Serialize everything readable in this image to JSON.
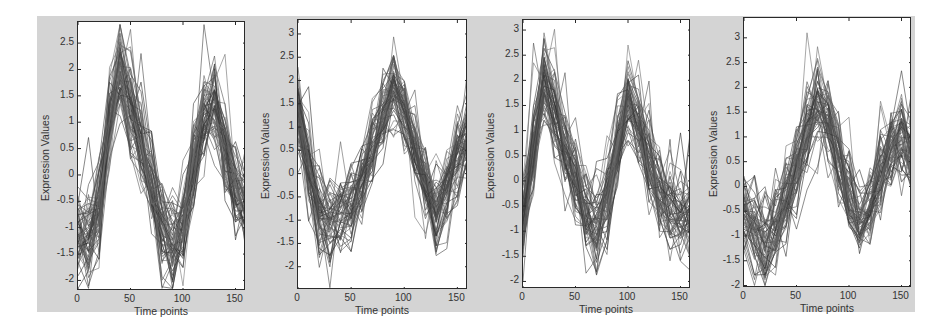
{
  "figure": {
    "background_color": "#d4d4d4",
    "plot_background": "#ffffff",
    "line_color": "#3c3c3c"
  },
  "chart_data": [
    {
      "type": "line",
      "title": "",
      "xlabel": "Time points",
      "ylabel": "Expression Values",
      "xlim": [
        0,
        160
      ],
      "ylim": [
        -2.2,
        2.9
      ],
      "xticks": [
        0,
        50,
        100,
        150
      ],
      "xtick_labels": [
        "0",
        "50",
        "100",
        "150"
      ],
      "yticks": [
        -2,
        -1.5,
        -1,
        -0.5,
        0,
        0.5,
        1,
        1.5,
        2,
        2.5
      ],
      "ytick_labels": [
        "-2",
        "-1.5",
        "-1",
        "-0.5",
        "0",
        "0.5",
        "1",
        "1.5",
        "2",
        "2.5"
      ],
      "grid": false,
      "series_count": 60,
      "description": "Cluster of ~60 gene expression profiles; peaks near t=40 and t=125, troughs near t=5 and t=95",
      "mean_profile": {
        "x": [
          0,
          10,
          20,
          30,
          40,
          50,
          60,
          70,
          80,
          90,
          100,
          110,
          120,
          130,
          140,
          150,
          160
        ],
        "y": [
          -1.1,
          -1.2,
          -0.6,
          0.9,
          1.8,
          1.2,
          0.5,
          -0.2,
          -0.9,
          -1.3,
          -0.9,
          0.2,
          1.0,
          1.2,
          0.4,
          -0.3,
          -0.6
        ]
      }
    },
    {
      "type": "line",
      "title": "",
      "xlabel": "Time points",
      "ylabel": "Expression Values",
      "xlim": [
        0,
        160
      ],
      "ylim": [
        -2.5,
        3.3
      ],
      "xticks": [
        0,
        50,
        100,
        150
      ],
      "xtick_labels": [
        "0",
        "50",
        "100",
        "150"
      ],
      "yticks": [
        -2,
        -1.5,
        -1,
        -0.5,
        0,
        0.5,
        1,
        1.5,
        2,
        2.5,
        3
      ],
      "ytick_labels": [
        "-2",
        "-1.5",
        "-1",
        "-0.5",
        "0",
        "0.5",
        "1",
        "1.5",
        "2",
        "2.5",
        "3"
      ],
      "grid": false,
      "series_count": 60,
      "description": "Cluster of ~60 gene expression profiles; high at t=0, trough near t=30, peak near t=90, trough near t=135",
      "mean_profile": {
        "x": [
          0,
          10,
          20,
          30,
          40,
          50,
          60,
          70,
          80,
          90,
          100,
          110,
          120,
          130,
          140,
          150,
          160
        ],
        "y": [
          1.2,
          0.0,
          -0.8,
          -1.0,
          -0.9,
          -0.7,
          -0.2,
          0.5,
          1.2,
          1.7,
          1.2,
          0.5,
          -0.2,
          -0.7,
          -0.4,
          0.3,
          0.6
        ]
      }
    },
    {
      "type": "line",
      "title": "",
      "xlabel": "Time points",
      "ylabel": "Expression Values",
      "xlim": [
        0,
        160
      ],
      "ylim": [
        -2.15,
        3.2
      ],
      "xticks": [
        0,
        50,
        100,
        150
      ],
      "xtick_labels": [
        "0",
        "50",
        "100",
        "150"
      ],
      "yticks": [
        -2,
        -1.5,
        -1,
        -0.5,
        0,
        0.5,
        1,
        1.5,
        2,
        2.5,
        3
      ],
      "ytick_labels": [
        "-2",
        "-1.5",
        "-1",
        "-0.5",
        "0",
        "0.5",
        "1",
        "1.5",
        "2",
        "2.5",
        "3"
      ],
      "grid": false,
      "series_count": 60,
      "description": "Cluster of ~60 gene expression profiles; peaks near t=20 and t=100, troughs near t=0, t=70 and t=150",
      "mean_profile": {
        "x": [
          0,
          10,
          20,
          30,
          40,
          50,
          60,
          70,
          80,
          90,
          100,
          110,
          120,
          130,
          140,
          150,
          160
        ],
        "y": [
          -0.8,
          0.6,
          1.9,
          1.3,
          0.6,
          0.0,
          -0.6,
          -1.0,
          -0.5,
          0.6,
          1.5,
          1.1,
          0.4,
          -0.3,
          -0.6,
          -0.8,
          -0.7
        ]
      }
    },
    {
      "type": "line",
      "title": "",
      "xlabel": "Time points",
      "ylabel": "Expression Values",
      "xlim": [
        0,
        160
      ],
      "ylim": [
        -2.05,
        3.4
      ],
      "xticks": [
        0,
        50,
        100,
        150
      ],
      "xtick_labels": [
        "0",
        "50",
        "100",
        "150"
      ],
      "yticks": [
        -2,
        -1.5,
        -1,
        -0.5,
        0,
        0.5,
        1,
        1.5,
        2,
        2.5,
        3
      ],
      "ytick_labels": [
        "-2",
        "-1.5",
        "-1",
        "-0.5",
        "0",
        "0.5",
        "1",
        "1.5",
        "2",
        "2.5",
        "3"
      ],
      "grid": false,
      "series_count": 60,
      "description": "Cluster of ~60 gene expression profiles; trough near t=20, peak near t=70, trough near t=110, rising toward t=150",
      "mean_profile": {
        "x": [
          0,
          10,
          20,
          30,
          40,
          50,
          60,
          70,
          80,
          90,
          100,
          110,
          120,
          130,
          140,
          150,
          160
        ],
        "y": [
          -0.6,
          -0.9,
          -1.2,
          -0.9,
          -0.4,
          0.3,
          1.1,
          1.7,
          1.3,
          0.6,
          -0.2,
          -0.7,
          -0.5,
          0.2,
          0.7,
          0.9,
          0.6
        ]
      }
    }
  ],
  "layout": {
    "panels": [
      {
        "plot": {
          "left": 77,
          "top": 21,
          "width": 168,
          "height": 269
        },
        "ylabel_x": 39
      },
      {
        "plot": {
          "left": 297,
          "top": 19,
          "width": 170,
          "height": 270
        },
        "ylabel_x": 259
      },
      {
        "plot": {
          "left": 522,
          "top": 19,
          "width": 168,
          "height": 269
        },
        "ylabel_x": 484
      },
      {
        "plot": {
          "left": 743,
          "top": 17,
          "width": 168,
          "height": 270
        },
        "ylabel_x": 707
      }
    ]
  }
}
